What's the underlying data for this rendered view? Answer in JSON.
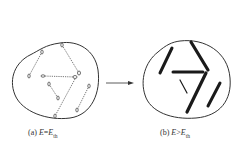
{
  "figure": {
    "panels": [
      {
        "id": "a",
        "label_prefix": "(a) ",
        "var": "E",
        "relation": "=",
        "threshold_var": "E",
        "threshold_sub": "th",
        "description": "Isolated thin dashed defect tracks (dipoles) inside region"
      },
      {
        "id": "b",
        "label_prefix": "(b) ",
        "var": "E",
        "relation": ">",
        "threshold_var": "E",
        "threshold_sub": "th",
        "description": "Thick solid connected tracks inside region"
      }
    ],
    "arrow": "right-arrow"
  }
}
